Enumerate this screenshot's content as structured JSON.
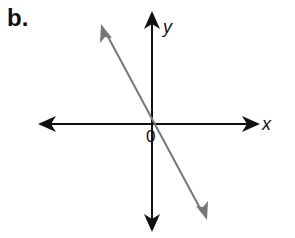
{
  "figure": {
    "part_label": "b.",
    "axes": {
      "x_label": "x",
      "y_label": "y",
      "origin_label": "0"
    },
    "line": {
      "description": "Line through the origin with negative slope",
      "slope_sign": "negative",
      "passes_through": "origin",
      "color": "#777777"
    },
    "colors": {
      "axes": "#111111",
      "line": "#777777",
      "background": "#ffffff"
    }
  }
}
